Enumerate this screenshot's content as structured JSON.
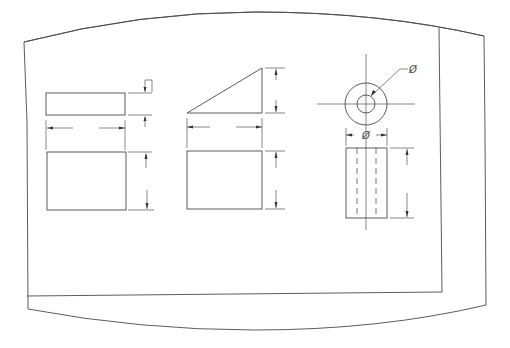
{
  "drawing": {
    "title": "Orthographic projection exercise sheet",
    "labels": {
      "diameter_leader": "Ø",
      "diameter_width": "Ø"
    },
    "views": [
      {
        "name": "rectangular-block",
        "top_view": {
          "x": 46,
          "y": 93,
          "w": 79,
          "h": 22
        },
        "front_view": {
          "x": 47,
          "y": 152,
          "w": 79,
          "h": 58
        }
      },
      {
        "name": "wedge",
        "top_view": {
          "points": "187,113 262,68 262,113"
        },
        "front_view": {
          "x": 187,
          "y": 151,
          "w": 75,
          "h": 58
        }
      },
      {
        "name": "hollow-cylinder",
        "top_view": {
          "cx": 366,
          "cy": 104,
          "r_outer": 21,
          "r_inner": 9
        },
        "front_view": {
          "x": 346,
          "y": 148,
          "w": 41,
          "h": 70
        }
      }
    ]
  }
}
